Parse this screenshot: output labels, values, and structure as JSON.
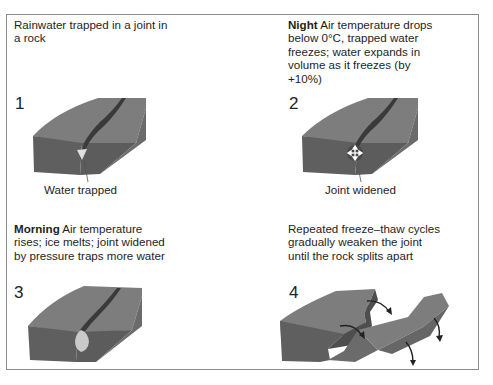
{
  "panels": [
    {
      "number": "1",
      "caption_bold": "",
      "caption": "Rainwater trapped in a joint in a rock",
      "caption_line1": "Rainwater trapped in a joint in",
      "caption_line2": "a rock",
      "label": "Water trapped"
    },
    {
      "number": "2",
      "caption_bold": "Night",
      "caption": "Air temperature drops below 0°C, trapped water freezes; water expands in volume as it freezes (by +10%)",
      "caption_line1": " Air temperature drops",
      "caption_line2": "below 0°C, trapped water",
      "caption_line3": "freezes; water expands in",
      "caption_line4": "volume as it freezes (by",
      "caption_line5": "+10%)",
      "label": "Joint widened"
    },
    {
      "number": "3",
      "caption_bold": "Morning",
      "caption": "Air temperature rises; ice melts; joint widened by pressure traps more water",
      "caption_line1": " Air temperature",
      "caption_line2": "rises; ice melts; joint widened",
      "caption_line3": "by pressure traps more water",
      "label": ""
    },
    {
      "number": "4",
      "caption_bold": "",
      "caption": "Repeated freeze–thaw cycles gradually weaken the joint until the rock splits apart",
      "caption_line1": "Repeated freeze–thaw cycles",
      "caption_line2": "gradually weaken the joint",
      "caption_line3": "until the rock splits apart",
      "label": ""
    }
  ],
  "colors": {
    "rock_top": "#7d7d7d",
    "rock_front": "#5f5f5f",
    "rock_side": "#6b6b6b",
    "joint": "#3a3a3a",
    "water": "#d9d9d9",
    "ice_marker": "#4a4a4a",
    "border": "#8c8c8c"
  },
  "icons": {
    "ice_expansion": "four-way-arrows-icon",
    "split_arrows": "curved-arrow-icon"
  }
}
